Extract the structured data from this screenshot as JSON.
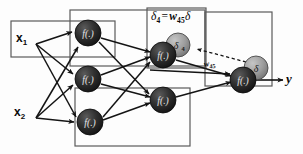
{
  "diagram": {
    "type": "neural-network",
    "background_color": "#fdfdfd",
    "line_color": "#1a1a1a",
    "box_color": "#555555",
    "node_fill_dark": "#2b2b2b",
    "node_fill_gray": "#9a9a9a"
  },
  "inputs": [
    {
      "id": "x1",
      "label": "x",
      "subscript": "1",
      "x": 18,
      "y": 38
    },
    {
      "id": "x2",
      "label": "x",
      "subscript": "2",
      "x": 16,
      "y": 112
    }
  ],
  "output": {
    "id": "y",
    "label": "y",
    "x": 288,
    "y": 76
  },
  "annotations": {
    "delta_formula": {
      "text": "δ₄ = w₄₅δ",
      "delta_symbol": "δ",
      "delta_subscript": "4",
      "equals": "=",
      "weight_symbol": "w",
      "weight_subscript": "45",
      "delta_symbol_2": "δ",
      "x": 152,
      "y": 11
    },
    "weight_label": {
      "text": "w₄₅",
      "symbol": "w",
      "subscript": "45",
      "x": 205,
      "y": 63
    }
  },
  "nodes": [
    {
      "id": "h1",
      "label": "f(.)",
      "cx": 88,
      "cy": 33,
      "r": 13,
      "layer": "hidden-1",
      "fill": "dark"
    },
    {
      "id": "h2",
      "label": "f(.)",
      "cx": 88,
      "cy": 79,
      "r": 13,
      "layer": "hidden-1",
      "fill": "dark"
    },
    {
      "id": "h3",
      "label": "f(.)",
      "cx": 90,
      "cy": 122,
      "r": 13,
      "layer": "hidden-1",
      "fill": "dark"
    },
    {
      "id": "n4",
      "label": "f(.)",
      "cx": 163,
      "cy": 55,
      "r": 13,
      "layer": "hidden-2",
      "fill": "dark"
    },
    {
      "id": "n4b",
      "label": "f(.)",
      "cx": 163,
      "cy": 100,
      "r": 13,
      "layer": "hidden-2",
      "fill": "dark"
    },
    {
      "id": "n5",
      "label": "f(.)",
      "cx": 243,
      "cy": 80,
      "r": 13,
      "layer": "output",
      "fill": "dark"
    }
  ],
  "delta_nodes": [
    {
      "id": "delta4",
      "label": "δ",
      "subscript": "4",
      "cx": 178,
      "cy": 45,
      "r": 12,
      "fill": "gray"
    },
    {
      "id": "delta5",
      "label": "δ",
      "subscript": "",
      "cx": 256,
      "cy": 68,
      "r": 12,
      "fill": "gray"
    }
  ],
  "boxes": [
    {
      "id": "input-box",
      "x": 11,
      "y": 21,
      "w": 104,
      "h": 36,
      "name": "input-x1-box"
    },
    {
      "id": "hidden-box-top",
      "x": 70,
      "y": 10,
      "w": 135,
      "h": 56,
      "name": "hidden-layer-top-box"
    },
    {
      "id": "hidden-box-bottom",
      "x": 75,
      "y": 88,
      "w": 115,
      "h": 58,
      "name": "hidden-layer-bottom-box"
    },
    {
      "id": "delta-box",
      "x": 147,
      "y": 8,
      "w": 59,
      "h": 60,
      "name": "delta-formula-box"
    },
    {
      "id": "output-box",
      "x": 205,
      "y": 12,
      "w": 67,
      "h": 74,
      "name": "output-layer-box"
    }
  ],
  "edges": {
    "forward_count": 15,
    "backward_dashed_count": 1,
    "description": "solid arrows = forward propagation, dashed arrow = backpropagated error"
  }
}
